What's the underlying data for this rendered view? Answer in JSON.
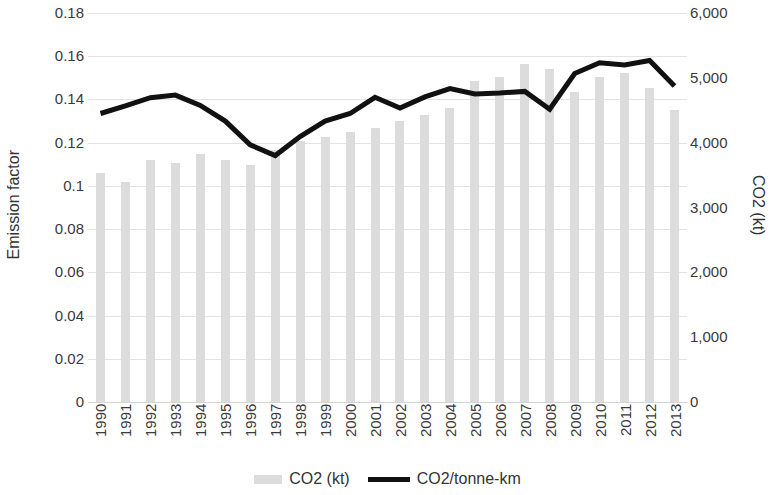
{
  "chart_data": {
    "type": "bar",
    "title": "",
    "xlabel": "",
    "categories": [
      "1990",
      "1991",
      "1992",
      "1993",
      "1994",
      "1995",
      "1996",
      "1997",
      "1998",
      "1999",
      "2000",
      "2001",
      "2002",
      "2003",
      "2004",
      "2005",
      "2006",
      "2007",
      "2008",
      "2009",
      "2010",
      "2011",
      "2012",
      "2013"
    ],
    "series": [
      {
        "name": "CO2 (kt)",
        "type": "bar",
        "axis": "right",
        "color": "#dcdcdc",
        "values": [
          3530,
          3400,
          3740,
          3680,
          3830,
          3740,
          3660,
          3890,
          4020,
          4090,
          4170,
          4220,
          4330,
          4420,
          4540,
          4950,
          5020,
          5220,
          5130,
          4780,
          5020,
          5080,
          4840,
          4510
        ]
      },
      {
        "name": "CO2/tonne-km",
        "type": "line",
        "axis": "left",
        "color": "#111111",
        "values": [
          0.1335,
          0.137,
          0.1408,
          0.142,
          0.1372,
          0.13,
          0.119,
          0.114,
          0.1228,
          0.13,
          0.1335,
          0.141,
          0.136,
          0.1412,
          0.145,
          0.1425,
          0.143,
          0.1437,
          0.1355,
          0.152,
          0.157,
          0.156,
          0.158,
          0.1462
        ]
      }
    ],
    "left_axis": {
      "label": "Emission factor",
      "ylim": [
        0,
        0.18
      ],
      "tick_step": 0.02,
      "ticks": [
        "0.18",
        "0.16",
        "0.14",
        "0.12",
        "0.1",
        "0.08",
        "0.06",
        "0.04",
        "0.02",
        "0"
      ]
    },
    "right_axis": {
      "label": "CO2 (kt)",
      "ylim": [
        0,
        6000
      ],
      "tick_step": 1000,
      "ticks": [
        "6,000",
        "5,000",
        "4,000",
        "3,000",
        "2,000",
        "1,000",
        "0"
      ]
    },
    "legend": {
      "position": "bottom",
      "entries": [
        {
          "label": "CO2 (kt)",
          "marker": "bar-swatch",
          "color": "#dcdcdc"
        },
        {
          "label": "CO2/tonne-km",
          "marker": "line-swatch",
          "color": "#111111"
        }
      ]
    },
    "grid": true
  }
}
